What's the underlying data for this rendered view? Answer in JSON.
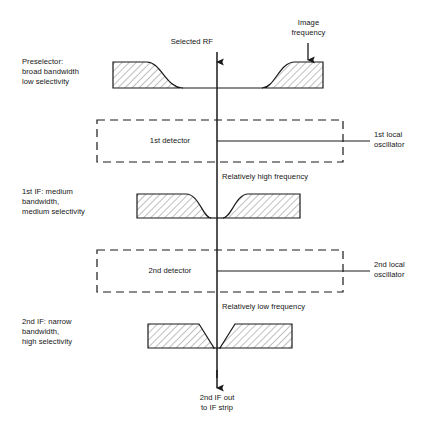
{
  "figure": {
    "width": 433,
    "height": 426,
    "background": "#ffffff",
    "line_color": "#1a1a1a",
    "hatch_color": "#8a8a8a",
    "text_color": "#151515"
  },
  "stage_labels": {
    "preselector": "Preselector:\nbroad bandwidth\nlow selectivity",
    "first_if": "1st IF: medium\nbandwidth,\nmedium selectivity",
    "second_if": "2nd IF: narrow\nbandwidth,\nhigh selectivity"
  },
  "callouts": {
    "selected_rf": "Selected RF",
    "image_frequency": "Image\nfrequency",
    "relatively_high_frequency": "Relatively high frequency",
    "relatively_low_frequency": "Relatively low frequency",
    "output": "2nd IF out\nto IF strip"
  },
  "detectors": [
    {
      "name": "first-detector",
      "label": "1st detector"
    },
    {
      "name": "second-detector",
      "label": "2nd detector"
    }
  ],
  "oscillators": [
    {
      "name": "first-local-oscillator",
      "label": "1st local\noscillator"
    },
    {
      "name": "second-local-oscillator",
      "label": "2nd local\noscillator"
    }
  ],
  "response_curves": [
    {
      "name": "preselector-response",
      "stage": "preselector",
      "shape": "broad-gradual-skirts",
      "selectivity": "low",
      "bandwidth": "broad",
      "baseline_y": 88,
      "top_y": 62,
      "left_block_x": [
        113,
        147
      ],
      "left_skirt_end_x": 183,
      "right_skirt_start_x": 262,
      "right_block_x": [
        295,
        323
      ]
    },
    {
      "name": "first-if-response",
      "stage": "first_if",
      "shape": "medium-steep-skirts",
      "selectivity": "medium",
      "bandwidth": "medium",
      "baseline_y": 218,
      "top_y": 194,
      "left_block_x": [
        137,
        186
      ],
      "left_skirt_end_x": 211,
      "right_skirt_start_x": 223,
      "right_block_x": [
        248,
        300
      ]
    },
    {
      "name": "second-if-response",
      "stage": "second_if",
      "shape": "narrow-straight-skirts",
      "selectivity": "high",
      "bandwidth": "narrow",
      "baseline_y": 348,
      "top_y": 324,
      "left_block_x": [
        148,
        199
      ],
      "left_skirt_end_x": 214,
      "right_skirt_start_x": 220,
      "right_block_x": [
        235,
        292
      ]
    }
  ],
  "signal_path": {
    "name": "signal-axis",
    "center_x": 217,
    "from_y": 52,
    "to_y": 388,
    "arrowheads": [
      {
        "at_y": 62,
        "label": "Selected RF"
      },
      {
        "at_y": 388,
        "label": "2nd IF out to IF strip"
      }
    ]
  }
}
